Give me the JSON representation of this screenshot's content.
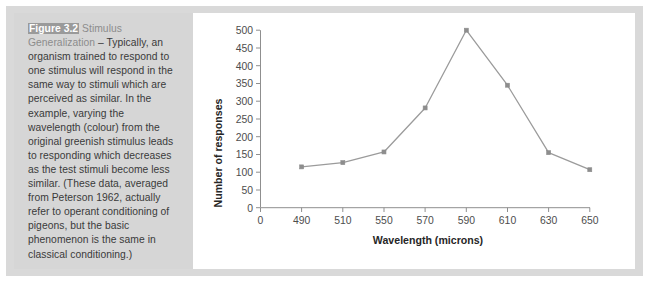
{
  "figure": {
    "label": "Figure 3.2",
    "subtitle": "Stimulus Generalization",
    "caption_body": " – Typically, an organism trained to respond to one stimulus will respond in the same way to stimuli which are perceived as similar. In the example, varying the wavelength (colour) from the original greenish stimulus leads to responding which decreases as the test stimuli become less similar. (These data, averaged from Peterson 1962, actually refer to operant conditioning of pigeons, but the basic phenomenon is the same in classical conditioning.)"
  },
  "colors": {
    "panel_background": "#d6d6d6",
    "frame": "#d9d9d9",
    "series": "#9b9b9b",
    "axis": "#8f8f8f",
    "caption_label_background": "#9a9a9a",
    "caption_text": "#3a3a3a"
  },
  "chart_data": {
    "type": "line",
    "title": "",
    "xlabel": "Wavelength (microns)",
    "ylabel": "Number of responses",
    "x_tick_labels": [
      "0",
      "490",
      "510",
      "550",
      "570",
      "590",
      "610",
      "630",
      "650"
    ],
    "categories": [
      490,
      510,
      550,
      570,
      590,
      610,
      630,
      650
    ],
    "values": [
      115,
      127,
      157,
      281,
      500,
      345,
      155,
      107
    ],
    "series": [
      {
        "name": "Number of responses",
        "values": [
          115,
          127,
          157,
          281,
          500,
          345,
          155,
          107
        ]
      }
    ],
    "y_tick_labels": [
      "0",
      "50",
      "100",
      "150",
      "200",
      "250",
      "300",
      "350",
      "400",
      "450",
      "500"
    ],
    "ylim": [
      0,
      500
    ],
    "y_tick_step": 50,
    "grid": false,
    "legend": "none",
    "markers": "square"
  }
}
